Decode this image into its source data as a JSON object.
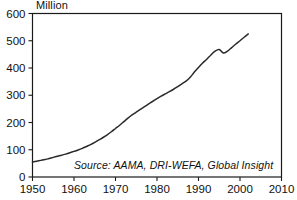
{
  "chart_data": {
    "type": "line",
    "title": "",
    "subtitle": "",
    "unit_label": "Million",
    "xlabel": "",
    "ylabel": "",
    "xlim": [
      1950,
      2010
    ],
    "ylim": [
      0,
      600
    ],
    "xticks": [
      1950,
      1960,
      1970,
      1980,
      1990,
      2000,
      2010
    ],
    "yticks": [
      0,
      100,
      200,
      300,
      400,
      500,
      600
    ],
    "xtick_labels": [
      "1950",
      "1960",
      "1970",
      "1980",
      "1990",
      "2000",
      "2010"
    ],
    "ytick_labels": [
      "0",
      "100",
      "200",
      "300",
      "400",
      "500",
      "600"
    ],
    "grid": false,
    "legend": false,
    "legend_position": "none",
    "annotations": [
      {
        "name": "source-note",
        "text": "Source: AAMA, DRI-WEFA, Global Insight",
        "style": "italic",
        "x": 1984,
        "y": 28
      }
    ],
    "series": [
      {
        "name": "vehicles",
        "color": "#2a2a2a",
        "x": [
          1950,
          1951,
          1952,
          1953,
          1954,
          1955,
          1956,
          1957,
          1958,
          1959,
          1960,
          1961,
          1962,
          1963,
          1964,
          1965,
          1966,
          1967,
          1968,
          1969,
          1970,
          1971,
          1972,
          1973,
          1974,
          1975,
          1976,
          1977,
          1978,
          1979,
          1980,
          1981,
          1982,
          1983,
          1984,
          1985,
          1986,
          1987,
          1988,
          1989,
          1990,
          1991,
          1992,
          1993,
          1994,
          1995,
          1996,
          1997,
          1998,
          1999,
          2000,
          2001,
          2002
        ],
        "values": [
          55,
          58,
          61,
          64,
          68,
          72,
          76,
          80,
          84,
          89,
          94,
          99,
          105,
          112,
          119,
          127,
          136,
          145,
          155,
          166,
          178,
          190,
          203,
          216,
          228,
          238,
          248,
          258,
          268,
          278,
          288,
          297,
          305,
          313,
          322,
          332,
          342,
          352,
          366,
          385,
          402,
          418,
          432,
          448,
          462,
          468,
          455,
          462,
          475,
          488,
          500,
          513,
          525
        ]
      }
    ]
  }
}
